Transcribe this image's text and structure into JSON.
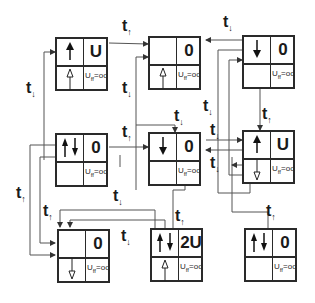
{
  "diagram": {
    "states": [
      {
        "id": "s1",
        "upper_spins": "up",
        "lower_spin": "up-hollow",
        "energy": "U",
        "interaction": "U_ff=oo"
      },
      {
        "id": "s2",
        "upper_spins": "",
        "lower_spin": "up-hollow",
        "energy": "0",
        "interaction": "U_ff=oo"
      },
      {
        "id": "s3",
        "upper_spins": "down",
        "lower_spin": "",
        "energy": "0",
        "interaction": "U_ff=oo"
      },
      {
        "id": "s4",
        "upper_spins": "up-down",
        "lower_spin": "",
        "energy": "0",
        "interaction": "U_ff=oo"
      },
      {
        "id": "s5",
        "upper_spins": "down",
        "lower_spin": "",
        "energy": "0",
        "interaction": "U_ff=oo"
      },
      {
        "id": "s6",
        "upper_spins": "up",
        "lower_spin": "down-hollow",
        "energy": "U",
        "interaction": "U_ff=oo"
      },
      {
        "id": "s7",
        "upper_spins": "",
        "lower_spin": "down-hollow",
        "energy": "0",
        "interaction": "U_ff=oo"
      },
      {
        "id": "s8",
        "upper_spins": "up-down",
        "lower_spin": "up-hollow",
        "energy": "2U",
        "interaction": "U_ff=oo"
      },
      {
        "id": "s9",
        "upper_spins": "up-down",
        "lower_spin": "",
        "energy": "0",
        "interaction": "U_ff=oo"
      }
    ],
    "uff_label": {
      "base": "U",
      "sub": "ff",
      "rest": "=oo"
    },
    "hopping_labels": [
      {
        "id": "h1",
        "t": "t",
        "spin": "↑"
      },
      {
        "id": "h2",
        "t": "t",
        "spin": "↓"
      },
      {
        "id": "h3",
        "t": "t",
        "spin": "↓"
      },
      {
        "id": "h4",
        "t": "t",
        "spin": "↓"
      },
      {
        "id": "h5",
        "t": "t",
        "spin": "↓"
      },
      {
        "id": "h6",
        "t": "t",
        "spin": "↑"
      },
      {
        "id": "h7",
        "t": "t",
        "spin": "↑"
      },
      {
        "id": "h8",
        "t": "t",
        "spin": "↓"
      },
      {
        "id": "h9",
        "t": "t",
        "spin": "↓"
      },
      {
        "id": "h10",
        "t": "t",
        "spin": "↑"
      },
      {
        "id": "h11",
        "t": "t",
        "spin": "↑"
      },
      {
        "id": "h12",
        "t": "t",
        "spin": "↑"
      },
      {
        "id": "h13",
        "t": "t",
        "spin": "↓"
      },
      {
        "id": "h14",
        "t": "t",
        "spin": "↓"
      },
      {
        "id": "h15",
        "t": "t",
        "spin": "↑"
      },
      {
        "id": "h16",
        "t": "t",
        "spin": "↓"
      }
    ]
  }
}
